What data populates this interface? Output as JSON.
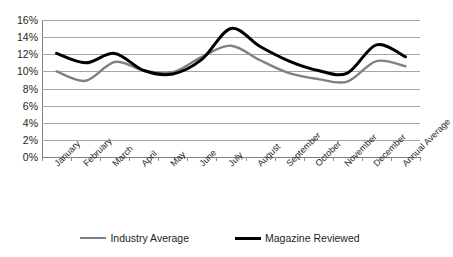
{
  "chart_data": {
    "type": "line",
    "title": "",
    "xlabel": "",
    "ylabel": "",
    "ylim": [
      0,
      16
    ],
    "y_tick_step": 2,
    "y_tick_labels": [
      "16%",
      "14%",
      "12%",
      "10%",
      "8%",
      "6%",
      "4%",
      "2%",
      "0%"
    ],
    "grid": true,
    "legend_position": "bottom-center",
    "categories": [
      "January",
      "February",
      "March",
      "April",
      "May",
      "June",
      "July",
      "August",
      "September",
      "October",
      "November",
      "December",
      "Annual Average"
    ],
    "series": [
      {
        "name": "Industry Average",
        "color": "#808080",
        "values": [
          10.0,
          8.9,
          11.1,
          10.1,
          9.9,
          11.7,
          13.0,
          11.3,
          9.8,
          9.1,
          8.8,
          11.2,
          10.6
        ]
      },
      {
        "name": "Magazine Reviewed",
        "color": "#000000",
        "values": [
          12.1,
          11.0,
          12.1,
          10.1,
          9.7,
          11.4,
          15.0,
          12.9,
          11.2,
          10.1,
          9.8,
          13.1,
          11.7
        ]
      }
    ]
  },
  "legend": {
    "entries": [
      {
        "label": "Industry Average",
        "swatch": "line-swatch-gray"
      },
      {
        "label": "Magazine Reviewed",
        "swatch": "line-swatch-black"
      }
    ]
  },
  "colors": {
    "industry_average": "#808080",
    "magazine_reviewed": "#000000",
    "gridline": "#a6a6a6",
    "axis": "#7f7f7f",
    "text": "#231f20",
    "background": "#ffffff"
  }
}
